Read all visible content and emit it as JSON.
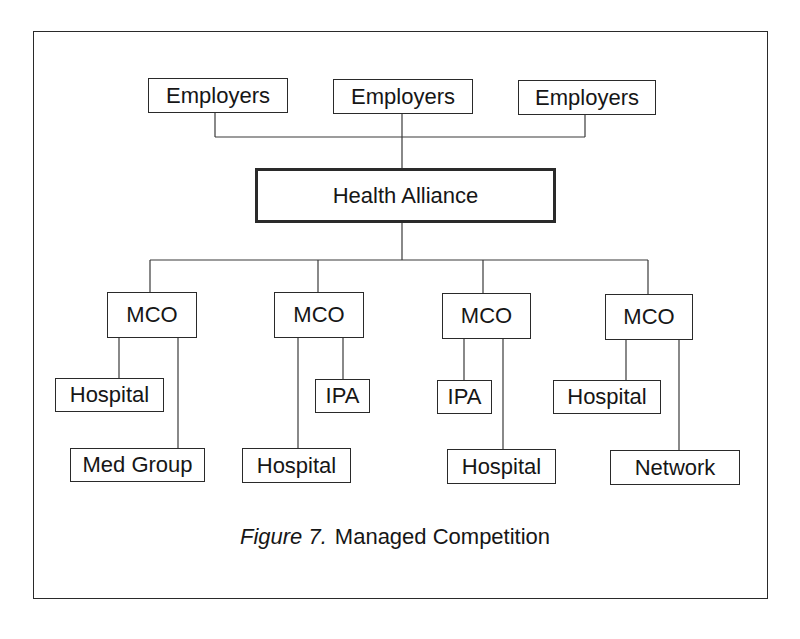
{
  "diagram": {
    "type": "hierarchy",
    "title": "Managed Competition",
    "caption": {
      "prefix": "Figure 7.",
      "text": "Managed Competition"
    },
    "top_level": [
      {
        "label": "Employers"
      },
      {
        "label": "Employers"
      },
      {
        "label": "Employers"
      }
    ],
    "alliance": {
      "label": "Health Alliance"
    },
    "mcos": [
      {
        "label": "MCO",
        "children": [
          {
            "label": "Hospital"
          },
          {
            "label": "Med Group"
          }
        ]
      },
      {
        "label": "MCO",
        "children": [
          {
            "label": "IPA"
          },
          {
            "label": "Hospital"
          }
        ]
      },
      {
        "label": "MCO",
        "children": [
          {
            "label": "IPA"
          },
          {
            "label": "Hospital"
          }
        ]
      },
      {
        "label": "MCO",
        "children": [
          {
            "label": "Hospital"
          },
          {
            "label": "Network"
          }
        ]
      }
    ],
    "edges": [
      [
        "Employers (1)",
        "Health Alliance"
      ],
      [
        "Employers (2)",
        "Health Alliance"
      ],
      [
        "Employers (3)",
        "Health Alliance"
      ],
      [
        "Health Alliance",
        "MCO (1)"
      ],
      [
        "Health Alliance",
        "MCO (2)"
      ],
      [
        "Health Alliance",
        "MCO (3)"
      ],
      [
        "Health Alliance",
        "MCO (4)"
      ],
      [
        "MCO (1)",
        "Hospital"
      ],
      [
        "MCO (1)",
        "Med Group"
      ],
      [
        "MCO (2)",
        "IPA"
      ],
      [
        "MCO (2)",
        "Hospital"
      ],
      [
        "MCO (3)",
        "IPA"
      ],
      [
        "MCO (3)",
        "Hospital"
      ],
      [
        "MCO (4)",
        "Hospital"
      ],
      [
        "MCO (4)",
        "Network"
      ]
    ]
  }
}
